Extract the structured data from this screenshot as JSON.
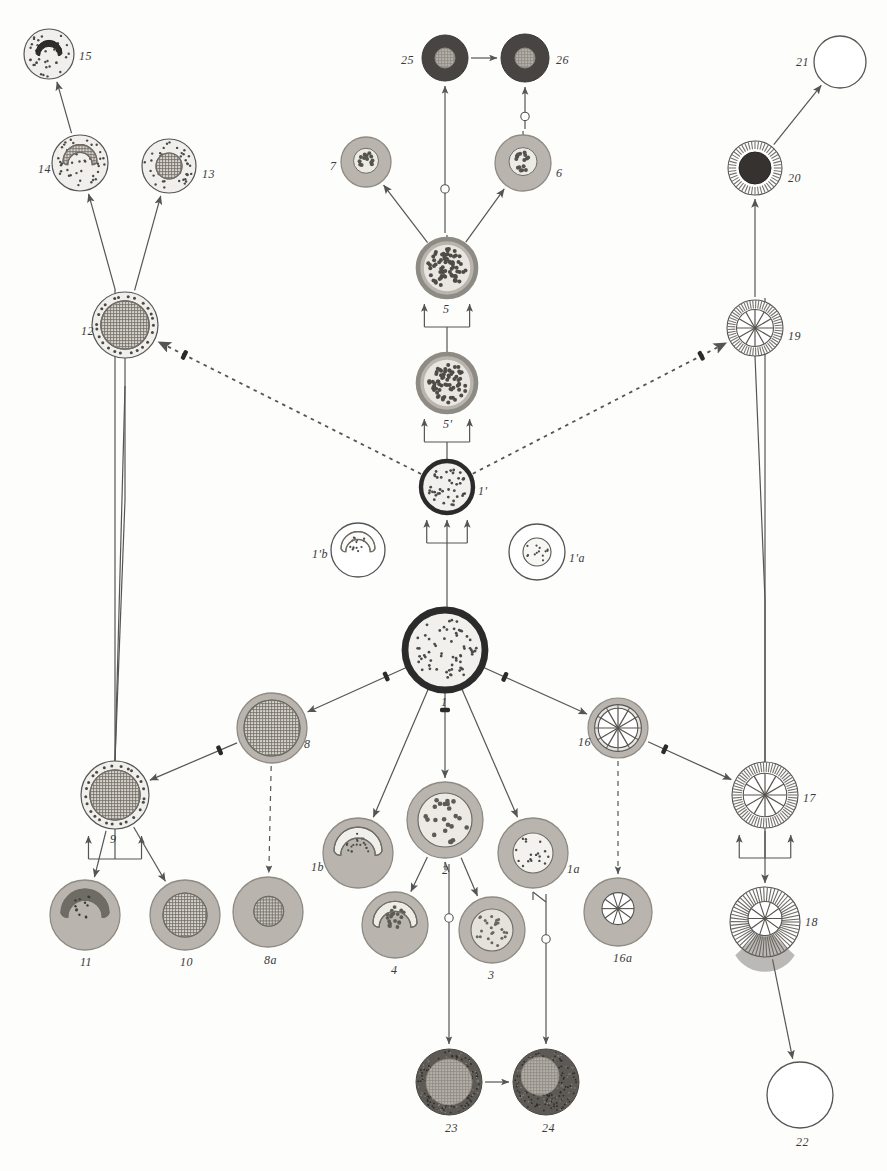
{
  "figure": {
    "background_color": "#fdfdfc",
    "ink_color": "#4a4a4a"
  },
  "palette": {
    "outline": "#555555",
    "arrow": "#555555",
    "heavy_ring": "#2b2b2b",
    "cytoplasm_light": "#f2f0ec",
    "cytoplasm_mid": "#b9b5ae",
    "cytoplasm_dark": "#8e8a84",
    "nucleus_dark": "#3a3a3a",
    "nucleus_hatch": "#6f6b65",
    "nucleus_pale": "#cfcbc4",
    "granule": "#4a4a4a"
  },
  "cells": [
    {
      "id": "15",
      "label": "15",
      "cx": 49,
      "cy": 54,
      "r": 25,
      "label_dx": 30,
      "label_dy": 2,
      "style": "pale-granular",
      "nucleus": "lobed-dark",
      "nr": 13
    },
    {
      "id": "14",
      "label": "14",
      "cx": 80,
      "cy": 163,
      "r": 28,
      "label_dx": -42,
      "label_dy": 6,
      "style": "pale-granular",
      "nucleus": "horseshoe-hatch",
      "nr": 17
    },
    {
      "id": "13",
      "label": "13",
      "cx": 169,
      "cy": 166,
      "r": 27,
      "label_dx": 33,
      "label_dy": 8,
      "style": "pale-granular",
      "nucleus": "round-hatch",
      "nr": 13
    },
    {
      "id": "12",
      "label": "12",
      "cx": 125,
      "cy": 325,
      "r": 33,
      "label_dx": -44,
      "label_dy": 6,
      "style": "rim-granular",
      "nucleus": "round-hatch",
      "nr": 24
    },
    {
      "id": "9",
      "label": "9",
      "cx": 115,
      "cy": 795,
      "r": 34,
      "label_dx": -5,
      "label_dy": 44,
      "style": "rim-granular",
      "nucleus": "round-hatch",
      "nr": 25
    },
    {
      "id": "11",
      "label": "11",
      "cx": 85,
      "cy": 915,
      "r": 35,
      "label_dx": -5,
      "label_dy": 47,
      "style": "mid-granular",
      "nucleus": "horseshoe-dark",
      "nr": 24
    },
    {
      "id": "10",
      "label": "10",
      "cx": 185,
      "cy": 915,
      "r": 35,
      "label_dx": -5,
      "label_dy": 47,
      "style": "mid-granular",
      "nucleus": "round-hatch",
      "nr": 22
    },
    {
      "id": "8",
      "label": "8",
      "cx": 272,
      "cy": 728,
      "r": 35,
      "label_dx": 32,
      "label_dy": 16,
      "style": "mid-plain",
      "nucleus": "round-hatch",
      "nr": 28
    },
    {
      "id": "8a",
      "label": "8a",
      "cx": 268,
      "cy": 912,
      "r": 35,
      "label_dx": -4,
      "label_dy": 48,
      "style": "mid-plain",
      "nucleus": "small-hatch",
      "nr": 15
    },
    {
      "id": "1b",
      "label": "1b",
      "cx": 358,
      "cy": 853,
      "r": 35,
      "label_dx": -47,
      "label_dy": 14,
      "style": "mid-plain",
      "nucleus": "horseshoe-pale",
      "nr": 24
    },
    {
      "id": "2",
      "label": "2",
      "cx": 445,
      "cy": 820,
      "r": 38,
      "label_dx": -3,
      "label_dy": 50,
      "style": "mid-plain",
      "nucleus": "round-speckled",
      "nr": 27
    },
    {
      "id": "4",
      "label": "4",
      "cx": 395,
      "cy": 925,
      "r": 33,
      "label_dx": -4,
      "label_dy": 45,
      "style": "mid-plain",
      "nucleus": "horseshoe-speckled",
      "nr": 22
    },
    {
      "id": "3",
      "label": "3",
      "cx": 492,
      "cy": 930,
      "r": 33,
      "label_dx": -4,
      "label_dy": 45,
      "style": "mid-plain",
      "nucleus": "round-speckled-small",
      "nr": 21
    },
    {
      "id": "1a",
      "label": "1a",
      "cx": 533,
      "cy": 853,
      "r": 35,
      "label_dx": 34,
      "label_dy": 16,
      "style": "mid-plain",
      "nucleus": "round-pale",
      "nr": 20
    },
    {
      "id": "16a",
      "label": "16a",
      "cx": 618,
      "cy": 912,
      "r": 34,
      "label_dx": -5,
      "label_dy": 46,
      "style": "mid-plain",
      "nucleus": "spoke-small",
      "nr": 16
    },
    {
      "id": "16",
      "label": "16",
      "cx": 618,
      "cy": 728,
      "r": 30,
      "label_dx": -40,
      "label_dy": 14,
      "style": "ring-spoke",
      "nucleus": "spokes",
      "nr": 24
    },
    {
      "id": "17",
      "label": "17",
      "cx": 765,
      "cy": 795,
      "r": 33,
      "label_dx": 38,
      "label_dy": 3,
      "style": "radial-striate",
      "nucleus": "spokes",
      "nr": 22
    },
    {
      "id": "18",
      "label": "18",
      "cx": 765,
      "cy": 922,
      "r": 35,
      "label_dx": 40,
      "label_dy": 0,
      "style": "radial-fan",
      "nucleus": "spoke-small",
      "nr": 17
    },
    {
      "id": "22",
      "label": "22",
      "cx": 800,
      "cy": 1095,
      "r": 33,
      "label_dx": -4,
      "label_dy": 47,
      "style": "empty",
      "nucleus": "none",
      "nr": 0
    },
    {
      "id": "19",
      "label": "19",
      "cx": 755,
      "cy": 328,
      "r": 28,
      "label_dx": 33,
      "label_dy": 8,
      "style": "radial-striate",
      "nucleus": "spokes",
      "nr": 19
    },
    {
      "id": "20",
      "label": "20",
      "cx": 755,
      "cy": 168,
      "r": 27,
      "label_dx": 33,
      "label_dy": 10,
      "style": "radial-striate",
      "nucleus": "round-black",
      "nr": 16
    },
    {
      "id": "21",
      "label": "21",
      "cx": 840,
      "cy": 62,
      "r": 26,
      "label_dx": -44,
      "label_dy": 0,
      "style": "empty",
      "nucleus": "none",
      "nr": 0
    },
    {
      "id": "1",
      "label": "1",
      "cx": 445,
      "cy": 650,
      "r": 40,
      "label_dx": -4,
      "label_dy": 52,
      "style": "heavy-ring-pale",
      "nucleus": "speckles",
      "nr": 32
    },
    {
      "id": "1'",
      "label": "1'",
      "cx": 447,
      "cy": 487,
      "r": 26,
      "label_dx": 31,
      "label_dy": 4,
      "style": "heavy-ring-pale",
      "nucleus": "speckles",
      "nr": 20
    },
    {
      "id": "1'b",
      "label": "1'b",
      "cx": 358,
      "cy": 550,
      "r": 27,
      "label_dx": -46,
      "label_dy": 4,
      "style": "empty-outline",
      "nucleus": "horseshoe-speck-pale",
      "nr": 17
    },
    {
      "id": "1'a",
      "label": "1'a",
      "cx": 537,
      "cy": 552,
      "r": 28,
      "label_dx": 32,
      "label_dy": 6,
      "style": "empty-outline",
      "nucleus": "round-speck-pale",
      "nr": 14
    },
    {
      "id": "5'",
      "label": "5'",
      "cx": 447,
      "cy": 383,
      "r": 29,
      "label_dx": -4,
      "label_dy": 41,
      "style": "mid-ring",
      "nucleus": "dense-speckles",
      "nr": 22
    },
    {
      "id": "5",
      "label": "5",
      "cx": 447,
      "cy": 268,
      "r": 29,
      "label_dx": -4,
      "label_dy": 41,
      "style": "mid-ring",
      "nucleus": "dense-speckles",
      "nr": 23
    },
    {
      "id": "7",
      "label": "7",
      "cx": 366,
      "cy": 162,
      "r": 25,
      "label_dx": -36,
      "label_dy": 4,
      "style": "mid-plain",
      "nucleus": "cluster-speckles",
      "nr": 13
    },
    {
      "id": "6",
      "label": "6",
      "cx": 523,
      "cy": 163,
      "r": 28,
      "label_dx": 33,
      "label_dy": 10,
      "style": "mid-plain",
      "nucleus": "cluster-speckles",
      "nr": 16
    },
    {
      "id": "25",
      "label": "25",
      "cx": 445,
      "cy": 58,
      "r": 23,
      "label_dx": -44,
      "label_dy": 2,
      "style": "very-dark",
      "nucleus": "round-hatch-pale",
      "nr": 10
    },
    {
      "id": "26",
      "label": "26",
      "cx": 525,
      "cy": 58,
      "r": 24,
      "label_dx": 31,
      "label_dy": 2,
      "style": "very-dark",
      "nucleus": "round-hatch-pale",
      "nr": 10
    },
    {
      "id": "23",
      "label": "23",
      "cx": 449,
      "cy": 1082,
      "r": 33,
      "label_dx": -4,
      "label_dy": 46,
      "style": "dark-stipple",
      "nucleus": "round-hatch-pale",
      "nr": 23
    },
    {
      "id": "24",
      "label": "24",
      "cx": 546,
      "cy": 1082,
      "r": 33,
      "label_dx": -4,
      "label_dy": 46,
      "style": "dark-stipple",
      "nucleus": "offset-hatch-pale",
      "nr": 19
    }
  ],
  "connections": [
    {
      "from": "12",
      "to": "14",
      "kind": "arrow"
    },
    {
      "from": "12",
      "to": "13",
      "kind": "arrow"
    },
    {
      "from": "14",
      "to": "15",
      "kind": "arrow"
    },
    {
      "from": "1'",
      "to": "12",
      "kind": "dashed-barred-arrow"
    },
    {
      "from": "1'",
      "to": "19",
      "kind": "dashed-barred-arrow"
    },
    {
      "from": "9",
      "to": "12",
      "kind": "plain-line"
    },
    {
      "from": "9",
      "to": "11",
      "kind": "arrow"
    },
    {
      "from": "9",
      "to": "10",
      "kind": "arrow"
    },
    {
      "from": "8",
      "to": "9",
      "kind": "barred-arrow"
    },
    {
      "from": "8",
      "to": "8a",
      "kind": "dashed-arrow"
    },
    {
      "from": "1",
      "to": "8",
      "kind": "barred-arrow"
    },
    {
      "from": "1",
      "to": "1b",
      "kind": "arrow"
    },
    {
      "from": "1",
      "to": "2",
      "kind": "barred-arrow"
    },
    {
      "from": "1",
      "to": "1a",
      "kind": "arrow"
    },
    {
      "from": "1",
      "to": "16",
      "kind": "barred-arrow"
    },
    {
      "from": "2",
      "to": "4",
      "kind": "arrow"
    },
    {
      "from": "2",
      "to": "3",
      "kind": "arrow"
    },
    {
      "from": "2",
      "to": "23",
      "kind": "circle-arrow"
    },
    {
      "from": "1a",
      "to": "24",
      "kind": "circle-arrow"
    },
    {
      "from": "23",
      "to": "24",
      "kind": "short-arrow"
    },
    {
      "from": "16",
      "to": "16a",
      "kind": "dashed-arrow"
    },
    {
      "from": "16",
      "to": "17",
      "kind": "barred-arrow"
    },
    {
      "from": "17",
      "to": "18",
      "kind": "arrow"
    },
    {
      "from": "18",
      "to": "22",
      "kind": "arrow"
    },
    {
      "from": "1",
      "to": "1'",
      "kind": "bracket-arrow"
    },
    {
      "from": "1'",
      "to": "5'",
      "kind": "bracket-arrow"
    },
    {
      "from": "5'",
      "to": "5",
      "kind": "bracket-arrow"
    },
    {
      "from": "5",
      "to": "7",
      "kind": "arrow"
    },
    {
      "from": "5",
      "to": "6",
      "kind": "arrow"
    },
    {
      "from": "5",
      "to": "25",
      "kind": "circle-arrow"
    },
    {
      "from": "6",
      "to": "26",
      "kind": "circle-arrow"
    },
    {
      "from": "25",
      "to": "26",
      "kind": "short-arrow"
    },
    {
      "from": "19",
      "to": "20",
      "kind": "arrow"
    },
    {
      "from": "20",
      "to": "21",
      "kind": "arrow"
    },
    {
      "from": "12",
      "to": "9",
      "kind": "bracket-arrow"
    },
    {
      "from": "19",
      "to": "17",
      "kind": "bracket-arrow"
    }
  ]
}
